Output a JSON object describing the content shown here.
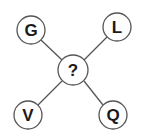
{
  "diagram": {
    "type": "letter-puzzle-star",
    "center": {
      "label": "?",
      "x": 73,
      "y": 70,
      "r": 15
    },
    "nodes": [
      {
        "id": "top-left",
        "label": "G",
        "x": 31,
        "y": 30,
        "r": 14
      },
      {
        "id": "top-right",
        "label": "L",
        "x": 117,
        "y": 27,
        "r": 14
      },
      {
        "id": "bottom-left",
        "label": "V",
        "x": 28,
        "y": 115,
        "r": 14
      },
      {
        "id": "bottom-right",
        "label": "Q",
        "x": 113,
        "y": 115,
        "r": 14
      }
    ],
    "colors": {
      "stroke": "#555555",
      "text": "#1a1a1a",
      "fill": "#ffffff"
    }
  }
}
